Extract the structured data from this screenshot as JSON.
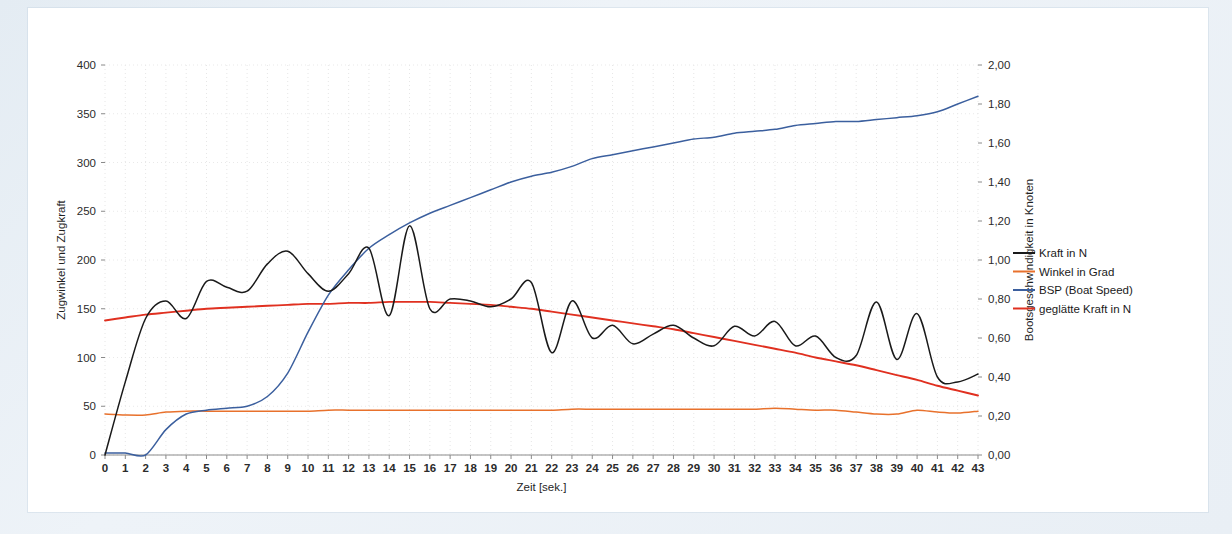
{
  "chart_data": {
    "type": "line",
    "title": "",
    "xlabel": "Zeit [sek.]",
    "ylabel": "Zugwinkel und Zugkraft",
    "y2label": "Bootsgeschwindigkeit in Knoten",
    "xlim": [
      0,
      43
    ],
    "ylim": [
      0,
      400
    ],
    "y2lim": [
      0,
      2.0
    ],
    "grid": true,
    "legend_position": "right",
    "x_ticks": [
      "0",
      "1",
      "2",
      "3",
      "4",
      "5",
      "6",
      "7",
      "8",
      "9",
      "10",
      "11",
      "12",
      "13",
      "14",
      "15",
      "16",
      "17",
      "18",
      "19",
      "20",
      "21",
      "22",
      "23",
      "24",
      "25",
      "26",
      "27",
      "28",
      "29",
      "30",
      "31",
      "32",
      "33",
      "34",
      "35",
      "36",
      "37",
      "38",
      "39",
      "40",
      "41",
      "42",
      "43"
    ],
    "y_ticks": [
      "0",
      "50",
      "100",
      "150",
      "200",
      "250",
      "300",
      "350",
      "400"
    ],
    "y2_ticks": [
      "0,00",
      "0,20",
      "0,40",
      "0,60",
      "0,80",
      "1,00",
      "1,20",
      "1,40",
      "1,60",
      "1,80",
      "2,00"
    ],
    "x": [
      0,
      1,
      2,
      3,
      4,
      5,
      6,
      7,
      8,
      9,
      10,
      11,
      12,
      13,
      14,
      15,
      16,
      17,
      18,
      19,
      20,
      21,
      22,
      23,
      24,
      25,
      26,
      27,
      28,
      29,
      30,
      31,
      32,
      33,
      34,
      35,
      36,
      37,
      38,
      39,
      40,
      41,
      42,
      43
    ],
    "series": [
      {
        "name": "Kraft in N",
        "color": "#1a1a1a",
        "axis": "left",
        "unit": "N",
        "values": [
          0,
          75,
          140,
          158,
          140,
          178,
          172,
          168,
          196,
          209,
          186,
          168,
          186,
          212,
          143,
          235,
          150,
          160,
          158,
          152,
          160,
          177,
          105,
          158,
          120,
          133,
          114,
          124,
          133,
          120,
          112,
          132,
          122,
          137,
          112,
          122,
          100,
          102,
          157,
          98,
          145,
          80,
          75,
          83
        ]
      },
      {
        "name": "Winkel in Grad",
        "color": "#e8712c",
        "axis": "left",
        "unit": "Grad",
        "values": [
          42,
          41,
          41,
          44,
          45,
          45,
          45,
          45,
          45,
          45,
          45,
          46,
          46,
          46,
          46,
          46,
          46,
          46,
          46,
          46,
          46,
          46,
          46,
          47,
          47,
          47,
          47,
          47,
          47,
          47,
          47,
          47,
          47,
          48,
          47,
          46,
          46,
          44,
          42,
          42,
          46,
          44,
          43,
          45
        ]
      },
      {
        "name": "BSP (Boat Speed)",
        "color": "#3b5f9e",
        "axis": "right",
        "unit": "Knoten",
        "values": [
          0.01,
          0.01,
          0.0,
          0.13,
          0.21,
          0.23,
          0.24,
          0.25,
          0.3,
          0.42,
          0.63,
          0.82,
          0.95,
          1.06,
          1.13,
          1.19,
          1.24,
          1.28,
          1.32,
          1.36,
          1.4,
          1.43,
          1.45,
          1.48,
          1.52,
          1.54,
          1.56,
          1.58,
          1.6,
          1.62,
          1.63,
          1.65,
          1.66,
          1.67,
          1.69,
          1.7,
          1.71,
          1.71,
          1.72,
          1.73,
          1.74,
          1.76,
          1.8,
          1.84
        ]
      },
      {
        "name": "geglätte Kraft in N",
        "color": "#e03020",
        "axis": "left",
        "unit": "N",
        "values": [
          138,
          141,
          144,
          146,
          148,
          150,
          151,
          152,
          153,
          154,
          155,
          155,
          156,
          156,
          157,
          157,
          157,
          156,
          155,
          154,
          152,
          150,
          147,
          144,
          141,
          138,
          135,
          132,
          129,
          125,
          121,
          117,
          113,
          109,
          105,
          100,
          96,
          92,
          87,
          82,
          77,
          71,
          66,
          61
        ]
      }
    ]
  },
  "legend": {
    "items": [
      {
        "label": "Kraft in N",
        "color": "#1a1a1a"
      },
      {
        "label": "Winkel in Grad",
        "color": "#e8712c"
      },
      {
        "label": "BSP (Boat Speed)",
        "color": "#3b5f9e"
      },
      {
        "label": "geglätte Kraft in N",
        "color": "#e03020"
      }
    ]
  }
}
